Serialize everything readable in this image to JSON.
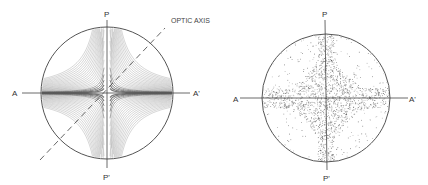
{
  "figures": [
    {
      "id": "left",
      "description": "Interference figure with isogyre cross and curved isochromatic bands",
      "center": [
        107,
        93
      ],
      "radius": 66,
      "labels": {
        "polarizer_top": "P",
        "polarizer_bottom": "P'",
        "analyzer_left": "A",
        "analyzer_right": "A'",
        "optic_axis": "OPTIC AXIS"
      }
    },
    {
      "id": "right",
      "description": "Stippled interference figure with dark four-pointed star pattern",
      "center": [
        326,
        98
      ],
      "radius": 64,
      "labels": {
        "polarizer_top": "P",
        "polarizer_bottom": "P'",
        "analyzer_left": "A",
        "analyzer_right": "A'"
      }
    }
  ],
  "colors": {
    "line": "#555555",
    "hatch": "#6a6a6a",
    "stipple": "#4a4a4a",
    "text": "#333333"
  }
}
